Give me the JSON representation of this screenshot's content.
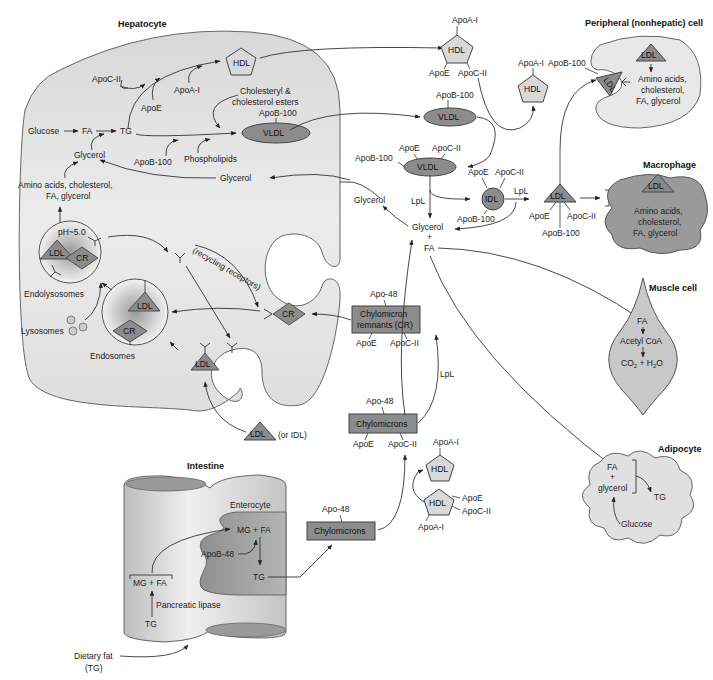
{
  "colors": {
    "cell_fill": "#e4e4e4",
    "cell_stroke": "#666666",
    "particle_dark": "#8c8c8c",
    "particle_light": "#d9d9d9",
    "enterocyte": "#a8a8a8",
    "macrophage": "#9a9a9a",
    "line": "#333333"
  },
  "hepatocyte": {
    "title": "Hepatocyte",
    "apoc2": "ApoC-II",
    "apoe": "ApoE",
    "apoa1": "ApoA-I",
    "hdl": "HDL",
    "chol_line1": "Cholesteryl &",
    "chol_line2": "cholesterol esters",
    "apob100": "ApoB-100",
    "vldl": "VLDL",
    "glucose": "Glucose",
    "fa": "FA",
    "tg": "TG",
    "glycerol_left": "Glycerol",
    "apob100_low": "ApoB-100",
    "phospholipids": "Phospholipids",
    "glycerol_right": "Glycerol",
    "amino_line1": "Amino acids, cholesterol,",
    "amino_line2": "FA, glycerol",
    "ph": "pH~5.0",
    "ldl_endolyso": "LDL",
    "cr_endolyso": "CR",
    "endolysosomes": "Endolysosomes",
    "lysosomes": "Lysosomes",
    "ldl_endo": "LDL",
    "cr_endo": "CR",
    "endosomes": "Endosomes",
    "recycling": "(recycling receptors)",
    "cr_pit": "CR",
    "ldl_pit": "LDL"
  },
  "circulation": {
    "hdl_top": {
      "label": "HDL",
      "apoa1": "ApoA-I",
      "apoe": "ApoE",
      "apoc2": "ApoC-II"
    },
    "vldl_top": {
      "label": "VLDL",
      "apob100": "ApoB-100"
    },
    "hdl_mid": {
      "label": "HDL",
      "apoa1": "ApoA-I"
    },
    "vldl_mid": {
      "label": "VLDL",
      "apoe": "ApoE",
      "apoc2": "ApoC-II",
      "apob100": "ApoB-100"
    },
    "idl": {
      "label": "IDL",
      "apoe": "ApoE",
      "apoc2": "ApoC-II",
      "apob100": "ApoB-100"
    },
    "ldl": {
      "label": "LDL",
      "apoe": "ApoE",
      "apoc2": "ApoC-II",
      "apob100": "ApoB-100"
    },
    "lpl_vldl": "LpL",
    "lpl_idl": "LpL",
    "lpl_chylo": "LpL",
    "glycerol_free": "Glycerol",
    "glycerol_mid": "Glycerol",
    "plus": "+",
    "fa_mid": "FA",
    "ldl_or_idl": {
      "ldl": "LDL",
      "note": "(or IDL)"
    },
    "cr_box": {
      "line1": "Chylomicron",
      "line2": "remnants (CR)",
      "apo48": "Apo-48",
      "apoe": "ApoE",
      "apoc2": "ApoC-II"
    },
    "chylo_box": {
      "label": "Chylomicrons",
      "apo48": "Apo-48",
      "apoe": "ApoE",
      "apoc2": "ApoC-II"
    },
    "chylo_new": {
      "label": "Chylomicrons",
      "apo48": "Apo-48"
    },
    "hdl_low_a": {
      "label": "HDL",
      "apoa1": "ApoA-I"
    },
    "hdl_low_b": {
      "label": "HDL",
      "apoe": "ApoE",
      "apoc2": "ApoC-II",
      "apoa1": "ApoA-I"
    }
  },
  "peripheral": {
    "title": "Peripheral (nonhepatic) cell",
    "apob100": "ApoB-100",
    "ldl_receptor": "LDL",
    "ldl_inside": "LDL",
    "line1": "Amino acids,",
    "line2": "cholesterol,",
    "line3": "FA, glycerol"
  },
  "macrophage": {
    "title": "Macrophage",
    "ldl": "LDL",
    "line1": "Amino acids,",
    "line2": "cholesterol,",
    "line3": "FA, glycerol"
  },
  "muscle": {
    "title": "Muscle cell",
    "fa": "FA",
    "acetyl": "Acetyl CoA",
    "co2": "CO",
    "co2_sub": "2",
    "plus_h2o": " + H",
    "h2o_sub": "2",
    "o": "O"
  },
  "adipocyte": {
    "title": "Adipocyte",
    "fa": "FA",
    "plus": "+",
    "glycerol": "glycerol",
    "tg": "TG",
    "glucose": "Glucose"
  },
  "intestine": {
    "title": "Intestine",
    "enterocyte": "Enterocyte",
    "mgfa_enterocyte": "MG + FA",
    "apob48": "ApoB-48",
    "tg_enterocyte": "TG",
    "mgfa_lumen": "MG + FA",
    "pancreatic_lipase": "Pancreatic lipase",
    "tg_lumen": "TG",
    "dietary1": "Dietary fat",
    "dietary2": "(TG)"
  }
}
